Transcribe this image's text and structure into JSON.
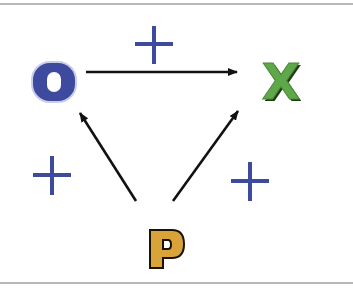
{
  "diagram": {
    "title": "",
    "nodes": [
      {
        "id": "O",
        "label": "O",
        "color": "#3d4a9e",
        "stroke": "#c9cdea"
      },
      {
        "id": "X",
        "label": "X",
        "color": "#5fa84a",
        "stroke": "#1f3c15"
      },
      {
        "id": "P",
        "label": "P",
        "color": "#d9a33a",
        "stroke": "#1a1204"
      }
    ],
    "edges": [
      {
        "from": "O",
        "to": "X",
        "sign": "+"
      },
      {
        "from": "P",
        "to": "O",
        "sign": "+"
      },
      {
        "from": "P",
        "to": "X",
        "sign": "+"
      }
    ],
    "sign_color": "#3e4a9c",
    "arrow_color": "#111111"
  }
}
